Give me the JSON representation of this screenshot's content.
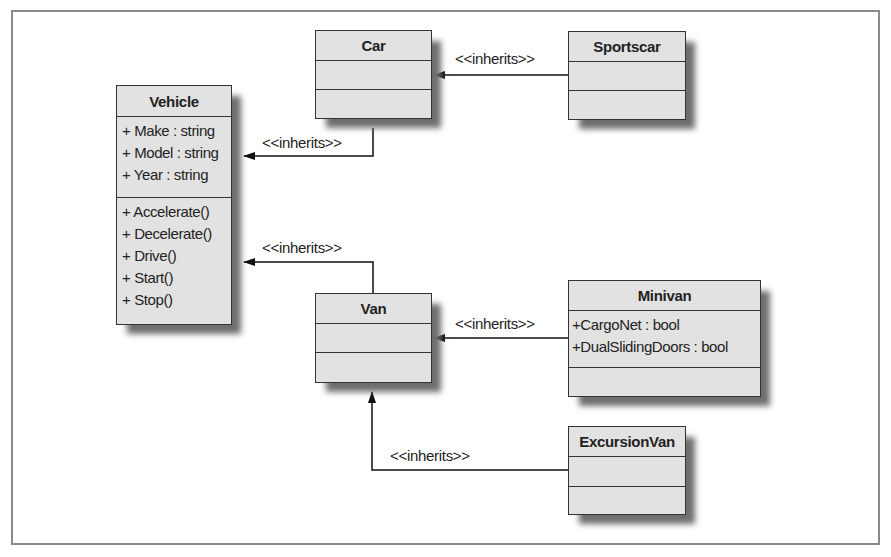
{
  "diagram": {
    "type": "UML class diagram",
    "classes": {
      "vehicle": {
        "name": "Vehicle",
        "attributes": [
          "+ Make : string",
          "+ Model : string",
          "+ Year : string"
        ],
        "methods": [
          "+ Accelerate()",
          "+ Decelerate()",
          "+ Drive()",
          "+ Start()",
          "+ Stop()"
        ]
      },
      "car": {
        "name": "Car",
        "attributes": [],
        "methods": []
      },
      "sportscar": {
        "name": "Sportscar",
        "attributes": [],
        "methods": []
      },
      "van": {
        "name": "Van",
        "attributes": [],
        "methods": []
      },
      "minivan": {
        "name": "Minivan",
        "attributes": [
          "+CargoNet : bool",
          "+DualSlidingDoors : bool"
        ],
        "methods": []
      },
      "excursionvan": {
        "name": "ExcursionVan",
        "attributes": [],
        "methods": []
      }
    },
    "relations": [
      {
        "from": "Sportscar",
        "to": "Car",
        "label": "<<inherits>>"
      },
      {
        "from": "Car",
        "to": "Vehicle",
        "label": "<<inherits>>"
      },
      {
        "from": "Van",
        "to": "Vehicle",
        "label": "<<inherits>>"
      },
      {
        "from": "Minivan",
        "to": "Van",
        "label": "<<inherits>>"
      },
      {
        "from": "ExcursionVan",
        "to": "Van",
        "label": "<<inherits>>"
      }
    ]
  },
  "colors": {
    "box_fill": "#e2e2e2",
    "box_border": "#333333",
    "shadow": "#6e6e6e",
    "frame": "#8a8a8a"
  }
}
